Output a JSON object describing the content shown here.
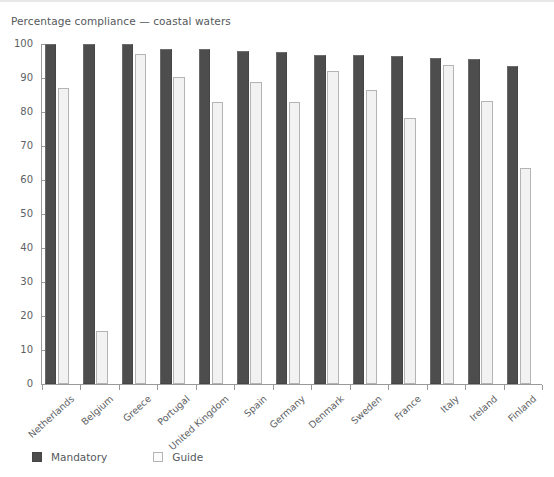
{
  "chart_data": {
    "type": "bar",
    "title": "Percentage compliance — coastal waters",
    "xlabel": "",
    "ylabel": "",
    "ylim": [
      0,
      100
    ],
    "yticks": [
      0,
      10,
      20,
      30,
      40,
      50,
      60,
      70,
      80,
      90,
      100
    ],
    "grid": false,
    "legend_position": "bottom-left",
    "categories": [
      "Netherlands",
      "Belgium",
      "Greece",
      "Portugal",
      "United Kingdom",
      "Spain",
      "Germany",
      "Denmark",
      "Sweden",
      "France",
      "Italy",
      "Ireland",
      "Finland"
    ],
    "series": [
      {
        "name": "Mandatory",
        "color": "#4d4d4d",
        "values": [
          100,
          100,
          100,
          98.6,
          98.6,
          98.0,
          97.6,
          96.8,
          96.8,
          96.6,
          96.0,
          95.7,
          93.6
        ]
      },
      {
        "name": "Guide",
        "color": "#f2f2f2",
        "values": [
          87.2,
          15.6,
          97.2,
          90.4,
          83.0,
          88.8,
          83.0,
          92.0,
          86.4,
          78.2,
          93.8,
          83.2,
          63.6
        ]
      }
    ]
  },
  "legend": {
    "items": [
      {
        "label": "Mandatory",
        "swatch": "mandatory"
      },
      {
        "label": "Guide",
        "swatch": "guide"
      }
    ]
  }
}
